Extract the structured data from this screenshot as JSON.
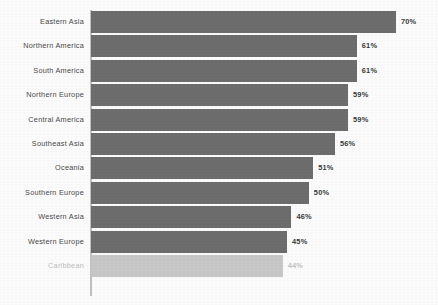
{
  "chart_data": {
    "type": "bar",
    "orientation": "horizontal",
    "title": "",
    "subtitle": "",
    "xlabel": "",
    "ylabel": "",
    "grid": false,
    "legend": false,
    "legend_position": "none",
    "xlim": [
      0,
      70
    ],
    "value_suffix": "%",
    "bar_color": "#6e6e6e",
    "highlight_color": "#c9c9c9",
    "axis_color": "#c2c2c2",
    "background_color": "#fdfdfd",
    "categories": [
      "Eastern Asia",
      "Northern America",
      "South America",
      "Northern Europe",
      "Central America",
      "Southeast Asia",
      "Oceania",
      "Southern Europe",
      "Western Asia",
      "Western Europe",
      "Caribbean"
    ],
    "values": [
      70,
      61,
      61,
      59,
      59,
      56,
      51,
      50,
      46,
      45,
      44
    ],
    "value_labels": [
      "70%",
      "61%",
      "61%",
      "59%",
      "59%",
      "56%",
      "51%",
      "50%",
      "46%",
      "45%",
      "44%"
    ],
    "dimmed": [
      false,
      false,
      false,
      false,
      false,
      false,
      false,
      false,
      false,
      false,
      true
    ]
  }
}
